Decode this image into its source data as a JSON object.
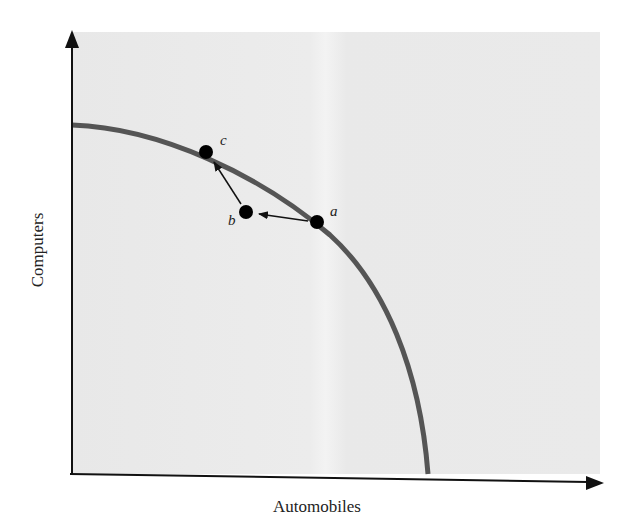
{
  "diagram": {
    "x_axis": {
      "label": "Automobiles"
    },
    "y_axis": {
      "label": "Computers"
    },
    "curve": {
      "color": "#555555",
      "description": "concave PPF"
    },
    "points": [
      {
        "id": "a",
        "label": "a",
        "position": "on curve"
      },
      {
        "id": "b",
        "label": "b",
        "position": "inside curve"
      },
      {
        "id": "c",
        "label": "c",
        "position": "on curve"
      }
    ],
    "arrows": [
      {
        "from": "a",
        "to": "b"
      },
      {
        "from": "b",
        "to": "c"
      }
    ],
    "colors": {
      "panel": "#e9e9e9",
      "axis": "#111111",
      "point": "#000000"
    }
  }
}
